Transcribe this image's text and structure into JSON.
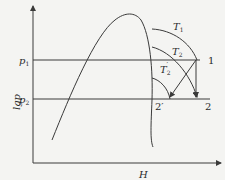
{
  "diagram": {
    "type": "lgp-H refrigeration diagram",
    "axes": {
      "y_label": "lgp",
      "x_label": "H"
    },
    "pressure_levels": [
      {
        "label": "p1",
        "text_main": "p",
        "text_sub": "1"
      },
      {
        "label": "p2",
        "text_main": "p",
        "text_sub": "2"
      }
    ],
    "isotherms": [
      {
        "label": "T1",
        "text_main": "T",
        "text_sub": "1"
      },
      {
        "label": "T2",
        "text_main": "T",
        "text_sub": "2"
      },
      {
        "label": "T2'",
        "text_main": "T",
        "text_sub": "2",
        "prime": "′"
      }
    ],
    "points": [
      {
        "id": "1",
        "label": "1"
      },
      {
        "id": "2",
        "label": "2"
      },
      {
        "id": "2'",
        "label": "2′"
      }
    ],
    "colors": {
      "line": "#3a3a3a",
      "background": "#f4f4f2"
    }
  }
}
